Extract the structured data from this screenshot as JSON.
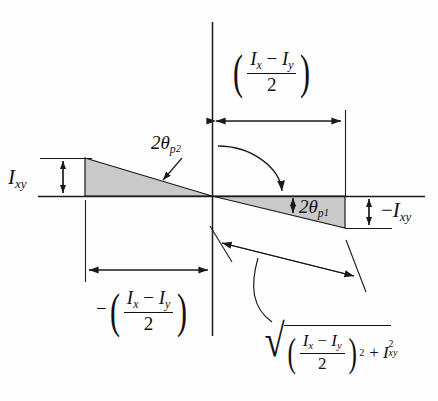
{
  "figure": {
    "type": "engineering-diagram",
    "colors": {
      "line": "#1a1a1a",
      "fill": "#c9c9c9",
      "background": "#fefefe"
    },
    "axes": {
      "horizontal": {
        "x1": 38,
        "x2": 425,
        "y": 196
      },
      "vertical": {
        "x": 212,
        "y1": 22,
        "y2": 336
      },
      "origin": {
        "x": 212,
        "y": 196
      }
    },
    "shapes": {
      "left_triangle": {
        "left_x": 85,
        "top_y": 158,
        "base_y": 196,
        "apex_x": 212
      },
      "right_triangle": {
        "apex_x": 212,
        "right_x": 345,
        "top_y": 196,
        "bottom_y": 228
      }
    },
    "labels": {
      "ixy_left": {
        "text": "I",
        "sub": "xy",
        "x": 8,
        "y": 164
      },
      "ixy_right": {
        "prefix": "−",
        "text": "I",
        "sub": "xy",
        "x": 382,
        "y": 196
      },
      "theta_p2": {
        "text": "2θ",
        "sub": "p",
        "sub2": "2",
        "x": 153,
        "y": 133
      },
      "theta_p1": {
        "text": "2θ",
        "sub": "p",
        "sub2": "1",
        "x": 300,
        "y": 196
      }
    },
    "expressions": {
      "top_right": {
        "sign": "",
        "numerator_left": "I",
        "numerator_left_sub": "x",
        "minus": "−",
        "numerator_right": "I",
        "numerator_right_sub": "y",
        "denominator": "2",
        "description": "(Ix - Iy)/2"
      },
      "bottom_left": {
        "sign": "−",
        "numerator_left": "I",
        "numerator_left_sub": "x",
        "minus": "−",
        "numerator_right": "I",
        "numerator_right_sub": "y",
        "denominator": "2",
        "description": "-(Ix - Iy)/2"
      },
      "radical": {
        "radical_sign": "√",
        "numerator_left": "I",
        "numerator_left_sub": "x",
        "minus": "−",
        "numerator_right": "I",
        "numerator_right_sub": "y",
        "denominator": "2",
        "power": "2",
        "plus": "+",
        "second_term": "I",
        "second_term_sub": "xy",
        "second_term_sup": "2",
        "description": "sqrt( ((Ix - Iy)/2)^2 + Ixy^2 )"
      }
    },
    "dimension_lines": {
      "top": {
        "y": 121,
        "x1": 212,
        "x2": 345,
        "label": "(Ix - Iy)/2"
      },
      "bottom_left": {
        "y": 270,
        "x1": 85,
        "x2": 212,
        "label": "-(Ix - Iy)/2"
      },
      "left_vertical": {
        "x": 63,
        "y1": 158,
        "y2": 196,
        "label": "Ixy"
      },
      "right_vertical": {
        "x": 369,
        "y1": 196,
        "y2": 228,
        "label": "-Ixy"
      },
      "diagonal": {
        "x1": 222,
        "y1": 243,
        "x2": 356,
        "y2": 276,
        "label": "radical"
      }
    }
  }
}
